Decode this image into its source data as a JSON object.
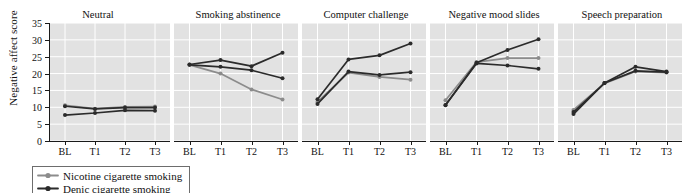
{
  "chart_data": {
    "type": "line",
    "title": "",
    "xlabel": "",
    "ylabel": "Negative affect score",
    "x": [
      "BL",
      "T1",
      "T2",
      "T3"
    ],
    "ylim": [
      0,
      35
    ],
    "yticks": [
      0,
      5,
      10,
      15,
      20,
      25,
      30,
      35
    ],
    "grid": true,
    "legend_position": "below-left",
    "panel_titles": [
      "Neutral",
      "Smoking abstinence",
      "Computer challenge",
      "Negative mood slides",
      "Speech preparation"
    ],
    "series_names": [
      "Nicotine cigarette smoking",
      "Denic cigarette smoking",
      "Denic cigarette smoking"
    ],
    "series_colors": [
      "#8c8c8c",
      "#2b2b2b",
      "#2b2b2b"
    ],
    "panels": [
      {
        "title": "Neutral",
        "series": [
          {
            "name": "Nicotine cigarette smoking",
            "color": "#8c8c8c",
            "values": [
              10.6,
              9.6,
              10.1,
              10.2
            ]
          },
          {
            "name": "Denic cigarette smoking",
            "color": "#2b2b2b",
            "values": [
              10.3,
              9.5,
              9.9,
              9.9
            ]
          },
          {
            "name": "Denic cigarette smoking",
            "color": "#2b2b2b",
            "values": [
              7.7,
              8.3,
              9.1,
              9.0
            ]
          }
        ]
      },
      {
        "title": "Smoking abstinence",
        "series": [
          {
            "name": "Nicotine cigarette smoking",
            "color": "#8c8c8c",
            "values": [
              22.6,
              20.0,
              15.3,
              12.3
            ]
          },
          {
            "name": "Denic cigarette smoking",
            "color": "#2b2b2b",
            "values": [
              22.7,
              24.0,
              22.2,
              26.2
            ]
          },
          {
            "name": "Denic cigarette smoking",
            "color": "#2b2b2b",
            "values": [
              22.6,
              22.0,
              21.0,
              18.6
            ]
          }
        ]
      },
      {
        "title": "Computer challenge",
        "series": [
          {
            "name": "Nicotine cigarette smoking",
            "color": "#8c8c8c",
            "values": [
              11.6,
              20.3,
              19.0,
              18.2
            ]
          },
          {
            "name": "Denic cigarette smoking",
            "color": "#2b2b2b",
            "values": [
              12.4,
              24.2,
              25.4,
              28.9
            ]
          },
          {
            "name": "Denic cigarette smoking",
            "color": "#2b2b2b",
            "values": [
              11.0,
              20.6,
              19.6,
              20.4
            ]
          }
        ]
      },
      {
        "title": "Negative mood slides",
        "series": [
          {
            "name": "Nicotine cigarette smoking",
            "color": "#8c8c8c",
            "values": [
              12.1,
              23.4,
              24.6,
              24.6
            ]
          },
          {
            "name": "Denic cigarette smoking",
            "color": "#2b2b2b",
            "values": [
              10.6,
              23.2,
              27.0,
              30.2
            ]
          },
          {
            "name": "Denic cigarette smoking",
            "color": "#2b2b2b",
            "values": [
              10.7,
              23.0,
              22.4,
              21.4
            ]
          }
        ]
      },
      {
        "title": "Speech preparation",
        "series": [
          {
            "name": "Nicotine cigarette smoking",
            "color": "#8c8c8c",
            "values": [
              9.2,
              17.1,
              20.6,
              20.3
            ]
          },
          {
            "name": "Denic cigarette smoking",
            "color": "#2b2b2b",
            "values": [
              8.0,
              17.2,
              22.0,
              20.6
            ]
          },
          {
            "name": "Denic cigarette smoking",
            "color": "#2b2b2b",
            "values": [
              8.6,
              17.2,
              20.8,
              20.4
            ]
          }
        ]
      }
    ]
  },
  "legend": {
    "items": [
      {
        "label": "Nicotine cigarette smoking",
        "color": "#8c8c8c"
      },
      {
        "label": "Denic cigarette smoking",
        "color": "#2b2b2b"
      }
    ]
  }
}
